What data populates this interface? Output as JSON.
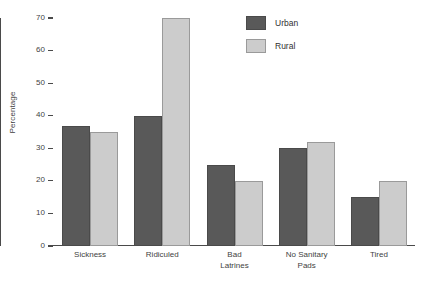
{
  "chart_data": {
    "type": "bar",
    "title": "",
    "xlabel": "",
    "ylabel": "Percentage",
    "ylim": [
      0,
      70
    ],
    "yticks": [
      0,
      10,
      20,
      30,
      40,
      50,
      60,
      70
    ],
    "grid": false,
    "legend_position": "top-center",
    "categories": [
      [
        "Sickness"
      ],
      [
        "Ridiculed"
      ],
      [
        "Bad",
        "Latrines"
      ],
      [
        "No Sanitary",
        "Pads"
      ],
      [
        "Tired"
      ]
    ],
    "category_labels": [
      "Sickness",
      "Ridiculed",
      "Bad Latrines",
      "No Sanitary Pads",
      "Tired"
    ],
    "series": [
      {
        "name": "Urban",
        "color": "#595959",
        "values": [
          37,
          40,
          25,
          30,
          15
        ]
      },
      {
        "name": "Rural",
        "color": "#cccccc",
        "values": [
          35,
          70,
          20,
          32,
          20
        ]
      }
    ]
  },
  "legend": {
    "items": [
      {
        "label": "Urban",
        "key": "urban"
      },
      {
        "label": "Rural",
        "key": "rural"
      }
    ]
  },
  "caption": {
    "partial_text": ""
  }
}
